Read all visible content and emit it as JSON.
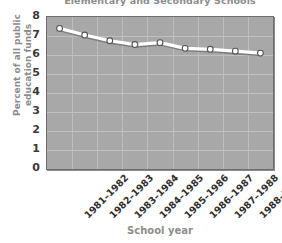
{
  "chart_data": {
    "type": "line",
    "title": "Elementary and Secondary Schools",
    "xlabel": "School year",
    "ylabel": "Percent of all public education funds",
    "ylabel_line1": "Percent of all public",
    "ylabel_line2": "education funds",
    "categories": [
      "1981–1982",
      "1982–1983",
      "1983–1984",
      "1984–1985",
      "1985–1986",
      "1986–1987",
      "1987–1988",
      "1988–1989",
      "1989–1990"
    ],
    "values": [
      7.4,
      7.05,
      6.75,
      6.55,
      6.65,
      6.35,
      6.3,
      6.2,
      6.1
    ],
    "ylim": [
      0,
      8
    ],
    "yticks": [
      8,
      7,
      6,
      5,
      4,
      3,
      2,
      1,
      0
    ],
    "grid": true,
    "legend": "none",
    "series": [
      {
        "name": "Percent of all public education funds",
        "values": [
          7.4,
          7.05,
          6.75,
          6.55,
          6.65,
          6.35,
          6.3,
          6.2,
          6.1
        ]
      }
    ],
    "colors": {
      "plot_background": "#a8a8a8",
      "grid": "#c0c0c0",
      "line": "#ffffff",
      "marker_fill": "#ffffff",
      "marker_edge": "#555555",
      "title_text": "#8d8d8d",
      "tick_text": "#2e2e2e",
      "axis_border": "#6e6e6e",
      "page_background": "#ffffff"
    }
  }
}
